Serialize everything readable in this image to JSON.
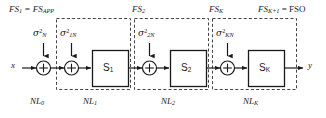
{
  "diagram": {
    "type": "block-diagram",
    "colors": {
      "stroke": "#1a1a1a",
      "dashed": "#444444",
      "background": "#ffffff",
      "text": "#1a1a1a"
    },
    "io": {
      "input_label": "x",
      "output_label": "y"
    },
    "top_labels": [
      {
        "name": "fs-1",
        "text": "FS",
        "sub": "1",
        "suffix": " = FS",
        "suffix_sub": "APP"
      },
      {
        "name": "fs-2",
        "text": "FS",
        "sub": "2",
        "suffix": "",
        "suffix_sub": ""
      },
      {
        "name": "fs-k",
        "text": "FS",
        "sub": "K",
        "suffix": "",
        "suffix_sub": ""
      },
      {
        "name": "fs-k1",
        "text": "FS",
        "sub": "K+1",
        "suffix": " = FSO",
        "suffix_sub": ""
      }
    ],
    "noise_labels": [
      {
        "name": "sigma-n",
        "symbol": "σ",
        "sup": "2",
        "sub": "N"
      },
      {
        "name": "sigma-1n",
        "symbol": "σ",
        "sup": "2",
        "sub": "1N"
      },
      {
        "name": "sigma-2n",
        "symbol": "σ",
        "sup": "2",
        "sub": "2N"
      },
      {
        "name": "sigma-kn",
        "symbol": "σ",
        "sup": "2",
        "sub": "KN"
      }
    ],
    "blocks": [
      {
        "name": "block-s1",
        "label": "S",
        "sub": "1"
      },
      {
        "name": "block-s2",
        "label": "S",
        "sub": "2"
      },
      {
        "name": "block-sk",
        "label": "S",
        "sub": "K"
      }
    ],
    "bottom_labels": [
      {
        "name": "nl-0",
        "text": "NL",
        "sub": "0"
      },
      {
        "name": "nl-1",
        "text": "NL",
        "sub": "1"
      },
      {
        "name": "nl-2",
        "text": "NL",
        "sub": "2"
      },
      {
        "name": "nl-k",
        "text": "NL",
        "sub": "K"
      }
    ],
    "adders": [
      {
        "name": "adder-0",
        "symbol": "+"
      },
      {
        "name": "adder-1",
        "symbol": "+"
      },
      {
        "name": "adder-2",
        "symbol": "+"
      },
      {
        "name": "adder-k",
        "symbol": "+"
      }
    ],
    "ellipsis": "···"
  }
}
